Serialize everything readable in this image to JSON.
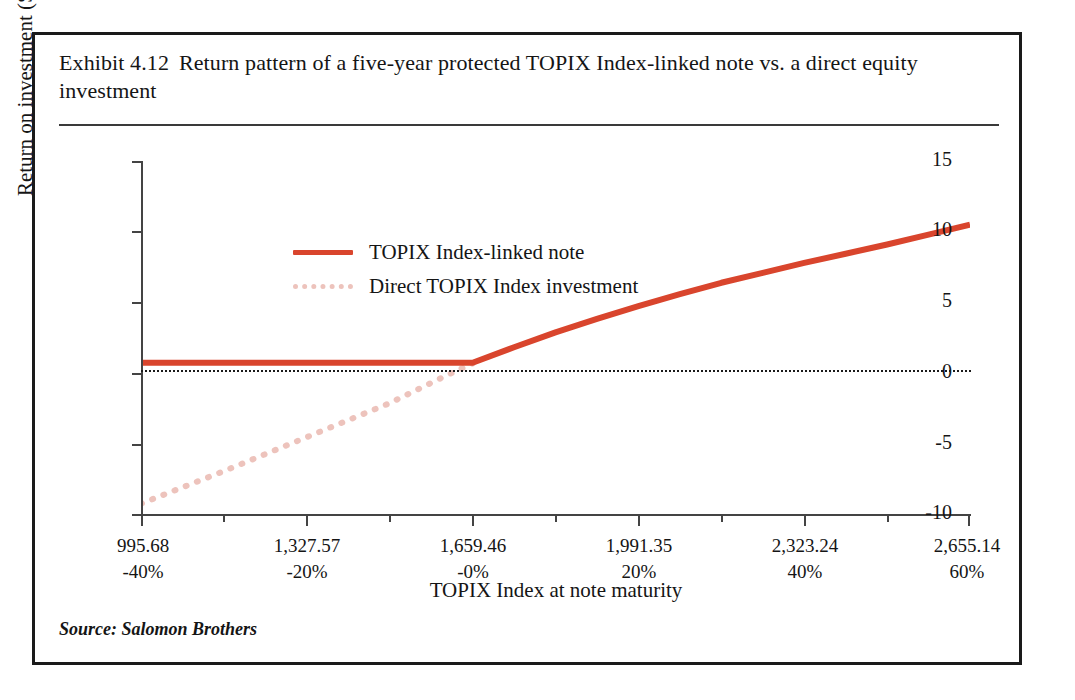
{
  "exhibit": {
    "number": "Exhibit 4.12",
    "title_line1": "Return pattern of a five-year protected TOPIX Index-linked note",
    "title_line2": "vs. a direct equity investment",
    "source": "Source: Salomon Brothers"
  },
  "colors": {
    "note_line": "#d9452d",
    "index_line": "#edc3bc",
    "zero_line": "#1a1a1a",
    "axis": "#444444",
    "frame": "#1a1a1a",
    "text": "#151515"
  },
  "legend": {
    "position": "top-left inside plot",
    "items": [
      {
        "label": "TOPIX Index-linked note",
        "style": "solid",
        "color": "#d9452d"
      },
      {
        "label": "Direct TOPIX Index investment",
        "style": "dotted",
        "color": "#edc3bc"
      }
    ]
  },
  "chart_data": {
    "type": "line",
    "xlabel": "TOPIX Index at note maturity",
    "ylabel": "Return on investment (S.A.) (%)",
    "grid": false,
    "legend_position": "top-left",
    "xlim": [
      -40,
      60
    ],
    "ylim": [
      -10,
      15
    ],
    "yticks": [
      15,
      10,
      5,
      0,
      -5,
      -10
    ],
    "ytick_labels": [
      "15",
      "10",
      "5",
      "0",
      "-5",
      "-10"
    ],
    "xticks": [
      -40,
      -20,
      0,
      20,
      40,
      60
    ],
    "xtick_labels_index": [
      "995.68",
      "1,327.57",
      "1,659.46",
      "1,991.35",
      "2,323.24",
      "2,655.14"
    ],
    "xtick_labels_pct": [
      "-40%",
      "-20%",
      "-0%",
      "20%",
      "40%",
      "60%"
    ],
    "x_minor_ticks": [
      -30,
      -10,
      10,
      30,
      50
    ],
    "zero_reference_line": 0,
    "series": [
      {
        "name": "TOPIX Index-linked note",
        "style": "solid",
        "color": "#d9452d",
        "x": [
          -40,
          -30,
          -20,
          -10,
          -4,
          0,
          5,
          10,
          15,
          20,
          25,
          30,
          35,
          40,
          45,
          50,
          55,
          60
        ],
        "values": [
          0.75,
          0.75,
          0.75,
          0.75,
          0.75,
          0.75,
          1.85,
          2.9,
          3.85,
          4.75,
          5.6,
          6.4,
          7.1,
          7.8,
          8.45,
          9.1,
          9.8,
          10.5
        ]
      },
      {
        "name": "Direct TOPIX Index investment",
        "style": "dotted",
        "color": "#edc3bc",
        "x": [
          -40,
          -30,
          -20,
          -10,
          -3,
          0
        ],
        "values": [
          -9.2,
          -6.9,
          -4.5,
          -2.1,
          -0.1,
          0.7
        ]
      }
    ],
    "annotations": [
      "Note return is floored near 0.75% for index levels at or below 1,659.46 (-0%), then participates in upside.",
      "Direct index investment line is drawn only over the negative-return region, meeting the note line near 0%."
    ]
  }
}
